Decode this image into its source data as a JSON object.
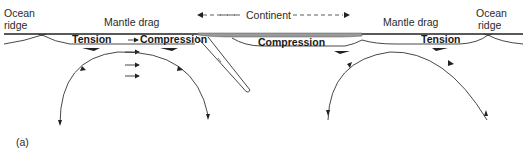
{
  "diagram": {
    "labels": {
      "ocean_ridge_left_line1": "Ocean",
      "ocean_ridge_left_line2": "ridge",
      "mantle_drag_left": "Mantle drag",
      "continent": "Continent",
      "mantle_drag_right": "Mantle drag",
      "ocean_ridge_right_line1": "Ocean",
      "ocean_ridge_right_line2": "ridge",
      "tension_left": "Tension",
      "compression_left": "Compression",
      "compression_center": "Compression",
      "tension_right": "Tension",
      "panel": "(a)"
    },
    "colors": {
      "line": "#333333",
      "continent_fill": "#9a9a9a",
      "background": "#ffffff"
    }
  }
}
